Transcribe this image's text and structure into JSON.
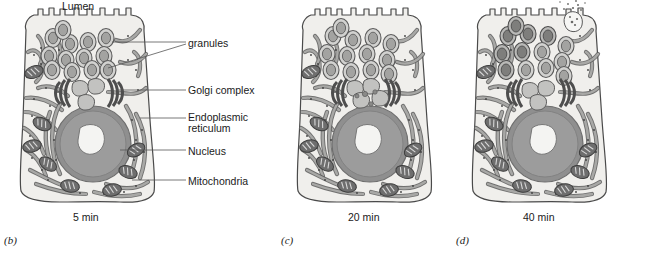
{
  "figure": {
    "title_top": "Lumen",
    "callouts": [
      {
        "key": "granules",
        "label": "granules",
        "x": 188,
        "y": 39
      },
      {
        "key": "golgi",
        "label": "Golgi complex",
        "x": 188,
        "y": 86
      },
      {
        "key": "er_line1",
        "label": "Endoplasmic",
        "x": 188,
        "y": 113
      },
      {
        "key": "er_line2",
        "label": "reticulum",
        "x": 188,
        "y": 124
      },
      {
        "key": "nucleus",
        "label": "Nucleus",
        "x": 188,
        "y": 147
      },
      {
        "key": "mitochondria",
        "label": "Mitochondria",
        "x": 188,
        "y": 177
      }
    ],
    "panels": [
      {
        "letter": "(b)",
        "time": "5 min",
        "letter_x": 4,
        "letter_y": 228,
        "time_x": 73,
        "time_y": 216,
        "cell_x": 8
      },
      {
        "letter": "(c)",
        "time": "20 min",
        "letter_x": 281,
        "letter_y": 228,
        "time_x": 348,
        "time_y": 216,
        "cell_x": 285
      },
      {
        "letter": "(d)",
        "time": "40 min",
        "letter_x": 456,
        "letter_y": 228,
        "time_x": 523,
        "time_y": 216,
        "cell_x": 460
      }
    ],
    "colors": {
      "cytoplasm": "#f0efec",
      "membrane_outline": "#4a4a4a",
      "nucleus_fill": "#9c9c9c",
      "nucleus_ring": "#7d7d7d",
      "nucleolus_fill": "#f2f2f0",
      "er_fill": "#a8a8a6",
      "er_outline": "#5a5a5a",
      "granule_outer": "#cfcfcd",
      "granule_inner": "#a0a09e",
      "mitochondria_fill": "#6e6e6e",
      "golgi_stack": "#5e5e5e",
      "vacuole_fill": "#bdbdbb",
      "leader_line": "#555555",
      "text": "#1a1a1a",
      "background": "#ffffff"
    },
    "structures": {
      "microvilli": "apical-microvilli",
      "secretion": "exocytosis-dots"
    }
  }
}
